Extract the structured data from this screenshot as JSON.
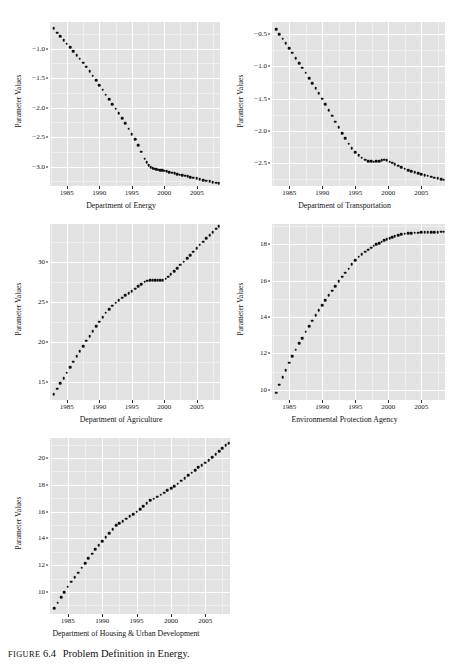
{
  "caption": {
    "figure_word": "FIGURE",
    "figure_number": "6.4",
    "text": "Problem Definition in Energy."
  },
  "top_clipped_text": "",
  "shared": {
    "ylabel": "Parameter Values",
    "x_ticks": [
      "1985",
      "1990",
      "1995",
      "2000",
      "2005"
    ],
    "x_tick_values": [
      1985,
      1990,
      1995,
      2000,
      2005
    ],
    "panel_bg": "#e3e3e3",
    "grid_color": "#ffffff",
    "point_color": "#111111"
  },
  "chart_data": [
    {
      "id": "dept-energy",
      "type": "scatter",
      "title": "",
      "xlabel": "Department of Energy",
      "ylabel": "Parameter Values",
      "xlim": [
        1982.4,
        2008.6
      ],
      "ylim": [
        -3.33,
        -0.55
      ],
      "y_ticks": [
        -1.0,
        -1.5,
        -2.0,
        -2.5,
        -3.0
      ],
      "y_tick_labels": [
        "−1.0",
        "−1.5",
        "−2.0",
        "−2.5",
        "−3.0"
      ],
      "grid": true,
      "x": [
        1983,
        1984,
        1985,
        1986,
        1987,
        1988,
        1989,
        1990,
        1991,
        1992,
        1993,
        1994,
        1995,
        1996,
        1997,
        1998,
        1999,
        2000,
        2001,
        2002,
        2003,
        2004,
        2005,
        2006,
        2007,
        2008
      ],
      "y": [
        -0.66,
        -0.79,
        -0.92,
        -1.04,
        -1.17,
        -1.31,
        -1.46,
        -1.62,
        -1.78,
        -1.94,
        -2.1,
        -2.27,
        -2.45,
        -2.64,
        -2.86,
        -3.02,
        -3.05,
        -3.06,
        -3.08,
        -3.1,
        -3.12,
        -3.14,
        -3.16,
        -3.18,
        -3.21,
        -3.24
      ],
      "x_dense": [
        1983.0,
        1983.5,
        1984.0,
        1984.5,
        1985.0,
        1985.5,
        1986.0,
        1986.5,
        1987.0,
        1987.5,
        1988.0,
        1988.5,
        1989.0,
        1989.5,
        1990.0,
        1990.5,
        1991.0,
        1991.5,
        1992.0,
        1992.5,
        1993.0,
        1993.5,
        1994.0,
        1994.5,
        1995.0,
        1995.5,
        1996.0,
        1996.5,
        1997.0,
        1997.3,
        1997.6,
        1997.9,
        1998.2,
        1998.5,
        1998.8,
        1999.1,
        1999.4,
        1999.7,
        2000.0,
        2000.4,
        2000.8,
        2001.2,
        2001.6,
        2002.0,
        2002.4,
        2002.8,
        2003.2,
        2003.6,
        2004.0,
        2004.5,
        2005.0,
        2005.5,
        2006.0,
        2006.5,
        2007.0,
        2007.5,
        2008.0,
        2008.4
      ],
      "y_dense": [
        -0.66,
        -0.73,
        -0.79,
        -0.86,
        -0.92,
        -0.98,
        -1.04,
        -1.11,
        -1.17,
        -1.24,
        -1.31,
        -1.38,
        -1.46,
        -1.54,
        -1.62,
        -1.7,
        -1.78,
        -1.86,
        -1.94,
        -2.02,
        -2.1,
        -2.18,
        -2.27,
        -2.36,
        -2.45,
        -2.54,
        -2.64,
        -2.75,
        -2.87,
        -2.93,
        -2.98,
        -3.01,
        -3.03,
        -3.04,
        -3.05,
        -3.055,
        -3.06,
        -3.065,
        -3.07,
        -3.082,
        -3.093,
        -3.104,
        -3.115,
        -3.126,
        -3.137,
        -3.148,
        -3.158,
        -3.168,
        -3.178,
        -3.19,
        -3.2,
        -3.215,
        -3.228,
        -3.24,
        -3.25,
        -3.262,
        -3.272,
        -3.28
      ]
    },
    {
      "id": "dept-transportation",
      "type": "scatter",
      "title": "",
      "xlabel": "Department of Transportation",
      "ylabel": "Parameter Values",
      "xlim": [
        1982.4,
        2008.6
      ],
      "ylim": [
        -2.86,
        -0.31
      ],
      "y_ticks": [
        -0.5,
        -1.0,
        -1.5,
        -2.0,
        -2.5
      ],
      "y_tick_labels": [
        "−0.5",
        "−1.0",
        "−1.5",
        "−2.0",
        "−2.5"
      ],
      "grid": true,
      "x": [
        1983,
        1984,
        1985,
        1986,
        1987,
        1988,
        1989,
        1990,
        1991,
        1992,
        1993,
        1994,
        1995,
        1996,
        1997,
        1998,
        1999,
        2000,
        2001,
        2002,
        2003,
        2004,
        2005,
        2006,
        2007,
        2008
      ],
      "y": [
        -0.42,
        -0.57,
        -0.72,
        -0.87,
        -1.02,
        -1.18,
        -1.34,
        -1.5,
        -1.68,
        -1.86,
        -2.04,
        -2.2,
        -2.33,
        -2.42,
        -2.47,
        -2.48,
        -2.45,
        -2.5,
        -2.55,
        -2.59,
        -2.63,
        -2.66,
        -2.69,
        -2.71,
        -2.74,
        -2.76
      ],
      "x_dense": [
        1983.0,
        1983.5,
        1984.0,
        1984.5,
        1985.0,
        1985.5,
        1986.0,
        1986.5,
        1987.0,
        1987.5,
        1988.0,
        1988.5,
        1989.0,
        1989.5,
        1990.0,
        1990.5,
        1991.0,
        1991.5,
        1992.0,
        1992.5,
        1993.0,
        1993.5,
        1994.0,
        1994.5,
        1995.0,
        1995.5,
        1996.0,
        1996.5,
        1997.0,
        1997.4,
        1997.8,
        1998.2,
        1998.6,
        1999.0,
        1999.4,
        1999.8,
        2000.2,
        2000.6,
        2001.0,
        2001.5,
        2002.0,
        2002.5,
        2003.0,
        2003.5,
        2004.0,
        2004.5,
        2005.0,
        2005.5,
        2006.0,
        2006.5,
        2007.0,
        2007.5,
        2008.0,
        2008.4
      ],
      "y_dense": [
        -0.42,
        -0.5,
        -0.57,
        -0.64,
        -0.72,
        -0.79,
        -0.87,
        -0.95,
        -1.02,
        -1.1,
        -1.18,
        -1.26,
        -1.34,
        -1.42,
        -1.5,
        -1.59,
        -1.68,
        -1.77,
        -1.86,
        -1.95,
        -2.04,
        -2.12,
        -2.2,
        -2.27,
        -2.33,
        -2.38,
        -2.42,
        -2.45,
        -2.47,
        -2.475,
        -2.48,
        -2.478,
        -2.47,
        -2.46,
        -2.45,
        -2.455,
        -2.48,
        -2.5,
        -2.52,
        -2.545,
        -2.57,
        -2.59,
        -2.61,
        -2.63,
        -2.645,
        -2.66,
        -2.675,
        -2.69,
        -2.7,
        -2.715,
        -2.73,
        -2.742,
        -2.755,
        -2.765
      ]
    },
    {
      "id": "dept-agriculture",
      "type": "scatter",
      "title": "",
      "xlabel": "Department of Agriculture",
      "ylabel": "Parameter Values",
      "xlim": [
        1982.4,
        2008.6
      ],
      "ylim": [
        12.8,
        34.8
      ],
      "y_ticks": [
        15,
        20,
        25,
        30
      ],
      "y_tick_labels": [
        "15",
        "20",
        "25",
        "30"
      ],
      "grid": true,
      "x": [
        1983,
        1984,
        1985,
        1986,
        1987,
        1988,
        1989,
        1990,
        1991,
        1992,
        1993,
        1994,
        1995,
        1996,
        1997,
        1998,
        1999,
        2000,
        2001,
        2002,
        2003,
        2004,
        2005,
        2006,
        2007,
        2008
      ],
      "y": [
        13.5,
        14.9,
        16.2,
        17.6,
        18.9,
        20.2,
        21.4,
        22.6,
        23.7,
        24.6,
        25.3,
        25.9,
        26.4,
        27.0,
        27.6,
        27.8,
        27.8,
        27.9,
        28.5,
        29.3,
        30.1,
        30.9,
        31.8,
        32.6,
        33.4,
        34.2
      ],
      "x_dense": [
        1983.0,
        1983.5,
        1984.0,
        1984.5,
        1985.0,
        1985.5,
        1986.0,
        1986.5,
        1987.0,
        1987.5,
        1988.0,
        1988.5,
        1989.0,
        1989.5,
        1990.0,
        1990.5,
        1991.0,
        1991.5,
        1992.0,
        1992.5,
        1993.0,
        1993.5,
        1994.0,
        1994.5,
        1995.0,
        1995.5,
        1996.0,
        1996.5,
        1997.0,
        1997.4,
        1997.8,
        1998.2,
        1998.6,
        1999.0,
        1999.4,
        1999.8,
        2000.2,
        2000.6,
        2001.0,
        2001.5,
        2002.0,
        2002.5,
        2003.0,
        2003.5,
        2004.0,
        2004.5,
        2005.0,
        2005.5,
        2006.0,
        2006.5,
        2007.0,
        2007.5,
        2008.0,
        2008.4
      ],
      "y_dense": [
        13.5,
        14.2,
        14.9,
        15.55,
        16.2,
        16.9,
        17.6,
        18.25,
        18.9,
        19.55,
        20.2,
        20.8,
        21.4,
        22.0,
        22.6,
        23.15,
        23.7,
        24.15,
        24.6,
        24.95,
        25.3,
        25.6,
        25.9,
        26.15,
        26.4,
        26.7,
        27.0,
        27.3,
        27.6,
        27.72,
        27.79,
        27.81,
        27.81,
        27.8,
        27.79,
        27.8,
        27.95,
        28.2,
        28.5,
        28.9,
        29.3,
        29.7,
        30.1,
        30.5,
        30.9,
        31.35,
        31.8,
        32.2,
        32.6,
        33.0,
        33.4,
        33.8,
        34.2,
        34.5
      ]
    },
    {
      "id": "epa",
      "type": "scatter",
      "title": "",
      "xlabel": "Environmental Protection Agency",
      "ylabel": "Parameter Values",
      "xlim": [
        1982.4,
        2008.6
      ],
      "ylim": [
        9.45,
        19.1
      ],
      "y_ticks": [
        10,
        12,
        14,
        16,
        18
      ],
      "y_tick_labels": [
        "10",
        "12",
        "14",
        "16",
        "18"
      ],
      "grid": true,
      "x": [
        1983,
        1984,
        1985,
        1986,
        1987,
        1988,
        1989,
        1990,
        1991,
        1992,
        1993,
        1994,
        1995,
        1996,
        1997,
        1998,
        1999,
        2000,
        2001,
        2002,
        2003,
        2004,
        2005,
        2006,
        2007,
        2008
      ],
      "y": [
        9.85,
        10.7,
        11.5,
        12.2,
        12.85,
        13.5,
        14.1,
        14.65,
        15.2,
        15.7,
        16.2,
        16.65,
        17.1,
        17.45,
        17.7,
        17.95,
        18.15,
        18.35,
        18.45,
        18.55,
        18.6,
        18.62,
        18.63,
        18.65,
        18.66,
        18.68
      ],
      "x_dense": [
        1983.0,
        1983.5,
        1984.0,
        1984.5,
        1985.0,
        1985.5,
        1986.0,
        1986.5,
        1987.0,
        1987.5,
        1988.0,
        1988.5,
        1989.0,
        1989.5,
        1990.0,
        1990.5,
        1991.0,
        1991.5,
        1992.0,
        1992.5,
        1993.0,
        1993.5,
        1994.0,
        1994.5,
        1995.0,
        1995.5,
        1996.0,
        1996.5,
        1997.0,
        1997.4,
        1997.8,
        1998.2,
        1998.6,
        1999.0,
        1999.4,
        1999.8,
        2000.2,
        2000.6,
        2001.0,
        2001.5,
        2002.0,
        2002.5,
        2003.0,
        2003.5,
        2004.0,
        2004.5,
        2005.0,
        2005.5,
        2006.0,
        2006.5,
        2007.0,
        2007.5,
        2008.0,
        2008.4
      ],
      "y_dense": [
        9.85,
        10.3,
        10.7,
        11.1,
        11.5,
        11.85,
        12.2,
        12.55,
        12.85,
        13.2,
        13.5,
        13.8,
        14.1,
        14.38,
        14.65,
        14.93,
        15.2,
        15.45,
        15.7,
        15.95,
        16.2,
        16.43,
        16.65,
        16.88,
        17.1,
        17.3,
        17.45,
        17.58,
        17.7,
        17.8,
        17.9,
        17.98,
        18.05,
        18.13,
        18.2,
        18.27,
        18.33,
        18.38,
        18.43,
        18.49,
        18.54,
        18.57,
        18.59,
        18.605,
        18.62,
        18.63,
        18.635,
        18.645,
        18.65,
        18.658,
        18.66,
        18.665,
        18.67,
        18.68
      ]
    },
    {
      "id": "hud",
      "type": "scatter",
      "title": "",
      "xlabel": "Department of Housing & Urban Development",
      "ylabel": "Parameter Values",
      "xlim": [
        1982.4,
        2008.6
      ],
      "ylim": [
        8.35,
        21.5
      ],
      "y_ticks": [
        10,
        12,
        14,
        16,
        18,
        20
      ],
      "y_tick_labels": [
        "10",
        "12",
        "14",
        "16",
        "18",
        "20"
      ],
      "grid": true,
      "x": [
        1983,
        1984,
        1985,
        1986,
        1987,
        1988,
        1989,
        1990,
        1991,
        1992,
        1993,
        1994,
        1995,
        1996,
        1997,
        1998,
        1999,
        2000,
        2001,
        2002,
        2003,
        2004,
        2005,
        2006,
        2007,
        2008
      ],
      "y": [
        8.8,
        9.6,
        10.4,
        11.1,
        11.8,
        12.5,
        13.2,
        13.8,
        14.4,
        15.0,
        15.3,
        15.65,
        16.0,
        16.4,
        16.85,
        17.1,
        17.4,
        17.75,
        18.1,
        18.5,
        18.9,
        19.3,
        19.65,
        20.05,
        20.5,
        20.95
      ],
      "x_dense": [
        1983.0,
        1983.5,
        1984.0,
        1984.5,
        1985.0,
        1985.5,
        1986.0,
        1986.5,
        1987.0,
        1987.5,
        1988.0,
        1988.5,
        1989.0,
        1989.5,
        1990.0,
        1990.5,
        1991.0,
        1991.5,
        1992.0,
        1992.5,
        1993.0,
        1993.5,
        1994.0,
        1994.5,
        1995.0,
        1995.5,
        1996.0,
        1996.5,
        1997.0,
        1997.5,
        1998.0,
        1998.5,
        1999.0,
        1999.5,
        2000.0,
        2000.5,
        2001.0,
        2001.5,
        2002.0,
        2002.5,
        2003.0,
        2003.5,
        2004.0,
        2004.5,
        2005.0,
        2005.5,
        2006.0,
        2006.5,
        2007.0,
        2007.5,
        2008.0,
        2008.4
      ],
      "y_dense": [
        8.8,
        9.2,
        9.6,
        10.0,
        10.4,
        10.75,
        11.1,
        11.45,
        11.8,
        12.15,
        12.5,
        12.85,
        13.2,
        13.5,
        13.8,
        14.1,
        14.4,
        14.7,
        15.0,
        15.15,
        15.3,
        15.48,
        15.65,
        15.82,
        16.0,
        16.2,
        16.4,
        16.63,
        16.85,
        16.98,
        17.1,
        17.25,
        17.4,
        17.58,
        17.75,
        17.92,
        18.1,
        18.3,
        18.5,
        18.7,
        18.9,
        19.1,
        19.3,
        19.48,
        19.65,
        19.85,
        20.05,
        20.28,
        20.5,
        20.73,
        20.95,
        21.1
      ]
    }
  ]
}
